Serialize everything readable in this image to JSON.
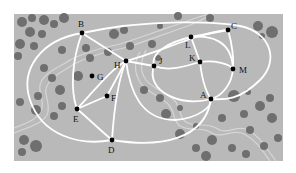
{
  "map": {
    "background": "#b9b9b9",
    "bush_color": "#6f6f6f",
    "path_color": "#ffffff",
    "stream_color": "#d4d4d4",
    "node_color": "#000000",
    "bounds": {
      "x": 14,
      "y": 14,
      "w": 269,
      "h": 147
    }
  },
  "nodes": [
    {
      "id": "A",
      "x": 211,
      "y": 99,
      "lx": 200,
      "ly": 98
    },
    {
      "id": "B",
      "x": 82,
      "y": 33,
      "lx": 78,
      "ly": 27
    },
    {
      "id": "C",
      "x": 228,
      "y": 30,
      "lx": 231,
      "ly": 29
    },
    {
      "id": "D",
      "x": 112,
      "y": 140,
      "lx": 108,
      "ly": 153
    },
    {
      "id": "E",
      "x": 77,
      "y": 109,
      "lx": 73,
      "ly": 122
    },
    {
      "id": "F",
      "x": 107,
      "y": 96,
      "lx": 111,
      "ly": 101
    },
    {
      "id": "G",
      "x": 92,
      "y": 76,
      "lx": 97,
      "ly": 80
    },
    {
      "id": "H",
      "x": 126,
      "y": 61,
      "lx": 114,
      "ly": 68
    },
    {
      "id": "J",
      "x": 154,
      "y": 66,
      "lx": 159,
      "ly": 64
    },
    {
      "id": "K",
      "x": 200,
      "y": 62,
      "lx": 189,
      "ly": 61
    },
    {
      "id": "L",
      "x": 191,
      "y": 37,
      "lx": 185,
      "ly": 48
    },
    {
      "id": "M",
      "x": 233,
      "y": 69,
      "lx": 239,
      "ly": 73
    }
  ]
}
